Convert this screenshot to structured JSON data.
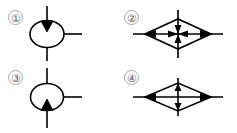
{
  "figure": {
    "background_color": "#ffffff",
    "stroke_color": "#000000",
    "label_color": "#59595b",
    "label_ring_color": "#a8a8aa",
    "width": 237,
    "height": 133
  },
  "items": [
    {
      "number": "①",
      "plain_number": "1",
      "shape": "circle",
      "description": "Circle with solid downward-pointing triangle at top, vertical lead above and below, horizontal lead to the right",
      "arrow_direction": "down",
      "leads": [
        "top",
        "bottom",
        "right"
      ],
      "fill": "none"
    },
    {
      "number": "②",
      "plain_number": "2",
      "shape": "diamond",
      "description": "Horizontal diamond with outward arrowheads at left and right tips and converging arrowheads at the centre, vertical axis line through centre",
      "arrow_direction": "outward-horizontal-and-centre-converging",
      "leads": [
        "left",
        "right",
        "top",
        "bottom"
      ],
      "fill": "none"
    },
    {
      "number": "③",
      "plain_number": "3",
      "shape": "circle",
      "description": "Circle with solid upward-pointing triangle at bottom, vertical lead above and below, horizontal lead to the right",
      "arrow_direction": "up",
      "leads": [
        "top",
        "bottom",
        "right"
      ],
      "fill": "none"
    },
    {
      "number": "④",
      "plain_number": "4",
      "shape": "diamond",
      "description": "Horizontal diamond with outward arrowheads at left and right tips and a vertical axis arrow pointing up at top and down at bottom centre",
      "arrow_direction": "vertical-up-and-down",
      "leads": [
        "left",
        "right",
        "top",
        "bottom"
      ],
      "fill": "none"
    }
  ]
}
